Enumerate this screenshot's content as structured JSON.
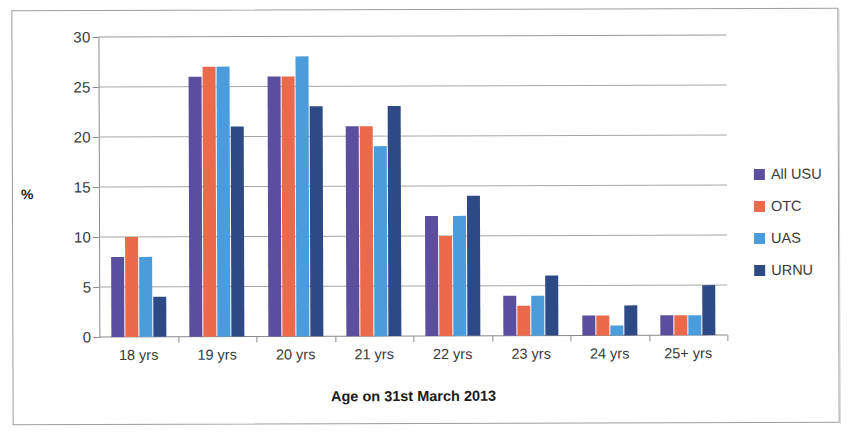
{
  "chart_data": {
    "type": "bar",
    "title": "",
    "xlabel": "Age on 31st March 2013",
    "ylabel": "%",
    "ylim": [
      0,
      30
    ],
    "ytick_step": 5,
    "yticks": [
      0,
      5,
      10,
      15,
      20,
      25,
      30
    ],
    "grid": true,
    "legend_position": "right",
    "categories": [
      "18 yrs",
      "19 yrs",
      "20 yrs",
      "21 yrs",
      "22 yrs",
      "23 yrs",
      "24 yrs",
      "25+ yrs"
    ],
    "series": [
      {
        "name": "All USU",
        "color": "#5b4e9e",
        "values": [
          8,
          26,
          26,
          21,
          12,
          4,
          2,
          2
        ]
      },
      {
        "name": "OTC",
        "color": "#ec6a4c",
        "values": [
          10,
          27,
          26,
          21,
          10,
          3,
          2,
          2
        ]
      },
      {
        "name": "UAS",
        "color": "#4a9cdc",
        "values": [
          8,
          27,
          28,
          19,
          12,
          4,
          1,
          2
        ]
      },
      {
        "name": "URNU",
        "color": "#2e4a86",
        "values": [
          4,
          21,
          23,
          23,
          14,
          6,
          3,
          5
        ]
      }
    ]
  },
  "legend": {
    "items": [
      {
        "label": "All USU",
        "color": "#5b4e9e"
      },
      {
        "label": "OTC",
        "color": "#ec6a4c"
      },
      {
        "label": "UAS",
        "color": "#4a9cdc"
      },
      {
        "label": "URNU",
        "color": "#2e4a86"
      }
    ]
  },
  "axes": {
    "y_title": "%",
    "x_title": "Age on 31st March 2013",
    "y_tick_labels": [
      "0",
      "5",
      "10",
      "15",
      "20",
      "25",
      "30"
    ],
    "x_tick_labels": [
      "18 yrs",
      "19 yrs",
      "20 yrs",
      "21 yrs",
      "22 yrs",
      "23 yrs",
      "24 yrs",
      "25+ yrs"
    ]
  },
  "colors": {
    "grid": "#a6a6a6",
    "axis": "#8c8c8c",
    "frame": "#9c9c9c",
    "text": "#3a3a3a"
  }
}
